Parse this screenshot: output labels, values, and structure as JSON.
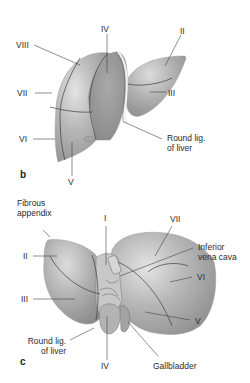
{
  "figure": {
    "panels": [
      {
        "id": "b",
        "letter": "b",
        "view": "anterior view of liver segments",
        "labels": {
          "viii": "VIII",
          "iv": "IV",
          "ii": "II",
          "vii": "VII",
          "iii": "III",
          "vi": "VI",
          "v": "V",
          "round_lig_1": "Round lig.",
          "round_lig_2": "of liver"
        }
      },
      {
        "id": "c",
        "letter": "c",
        "view": "visceral (inferior) view of liver segments",
        "labels": {
          "fibrous_1": "Fibrous",
          "fibrous_2": "appendix",
          "i": "I",
          "vii": "VII",
          "ivc_1": "Inferior",
          "ivc_2": "vena cava",
          "ii": "II",
          "vi": "VI",
          "iii": "III",
          "v": "V",
          "round_lig_1": "Round lig.",
          "round_lig_2": "of liver",
          "iv": "IV",
          "gallbladder": "Gallbladder"
        }
      }
    ],
    "colors": {
      "liver_fill": "#b9b9b9",
      "liver_shade": "#8f8f8f",
      "liver_highlight": "#e6e6e6",
      "segment_line": "#3d3d3d",
      "leader_line": "#444444"
    }
  }
}
